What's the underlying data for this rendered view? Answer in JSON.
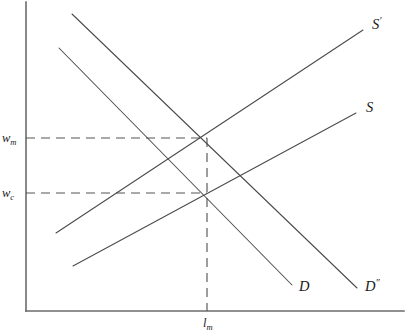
{
  "figure": {
    "background_color": "#ffffff",
    "axis_color": "#6b6b6b",
    "curve_color": "#4a4a4a",
    "guide_color": "#555555",
    "text_color": "#1a1a1a"
  },
  "axes": {
    "origin": {
      "x": 26,
      "y": 311
    },
    "y_top": 2,
    "x_right": 404
  },
  "labels": {
    "supply_shifted": {
      "base": "S",
      "prime": "′"
    },
    "supply": {
      "base": "S",
      "prime": ""
    },
    "demand": {
      "base": "D",
      "prime": ""
    },
    "demand_shifted": {
      "base": "D",
      "prime": "″"
    },
    "wage_monopsony": {
      "base": "w",
      "sub": "m"
    },
    "wage_competitive": {
      "base": "w",
      "sub": "c"
    },
    "labor_monopsony": {
      "base": "l",
      "sub": "m"
    }
  },
  "chart_data": {
    "type": "line",
    "title": "",
    "xlabel": "",
    "ylabel": "",
    "grid": false,
    "legend": "inline-end-of-curve",
    "xlim": [
      26,
      404
    ],
    "ylim": [
      311,
      2
    ],
    "axis_orientation": "y-up",
    "series": [
      {
        "name": "S′",
        "role": "supply-shifted",
        "label_text": "S′",
        "label_pos": {
          "x": 372,
          "y": 29
        },
        "points": [
          {
            "x": 56,
            "y": 233
          },
          {
            "x": 363,
            "y": 30
          }
        ]
      },
      {
        "name": "S",
        "role": "supply",
        "label_text": "S",
        "label_pos": {
          "x": 366,
          "y": 112
        },
        "points": [
          {
            "x": 73,
            "y": 266
          },
          {
            "x": 356,
            "y": 113
          }
        ]
      },
      {
        "name": "D″",
        "role": "demand-shifted",
        "label_text": "D″",
        "label_pos": {
          "x": 365,
          "y": 291
        },
        "points": [
          {
            "x": 72,
            "y": 14
          },
          {
            "x": 357,
            "y": 288
          }
        ]
      },
      {
        "name": "D",
        "role": "demand",
        "label_text": "D",
        "label_pos": {
          "x": 299,
          "y": 291
        },
        "points": [
          {
            "x": 59,
            "y": 48
          },
          {
            "x": 292,
            "y": 285
          }
        ]
      }
    ],
    "intersections": [
      {
        "name": "monopsony-equilibrium",
        "x": 207,
        "y": 138,
        "wage_label": "w_m",
        "quantity_label": "l_m",
        "curves": [
          "S",
          "D″"
        ]
      },
      {
        "name": "competitive-equilibrium",
        "x": 207,
        "y": 193,
        "wage_label": "w_c",
        "quantity_label": "l_m",
        "curves": [
          "S",
          "D"
        ]
      }
    ],
    "guides": [
      {
        "name": "wm-horizontal-guide",
        "orientation": "horizontal",
        "from": {
          "x": 26,
          "y": 138
        },
        "to": {
          "x": 207,
          "y": 138
        },
        "dashed": true
      },
      {
        "name": "wc-horizontal-guide",
        "orientation": "horizontal",
        "from": {
          "x": 26,
          "y": 193
        },
        "to": {
          "x": 207,
          "y": 193
        },
        "dashed": true
      },
      {
        "name": "lm-vertical-guide",
        "orientation": "vertical",
        "from": {
          "x": 207,
          "y": 138
        },
        "to": {
          "x": 207,
          "y": 311
        },
        "dashed": true
      }
    ],
    "tick_labels": {
      "y": [
        {
          "text": "w_m",
          "y": 138
        },
        {
          "text": "w_c",
          "y": 193
        }
      ],
      "x": [
        {
          "text": "l_m",
          "x": 207
        }
      ]
    }
  }
}
